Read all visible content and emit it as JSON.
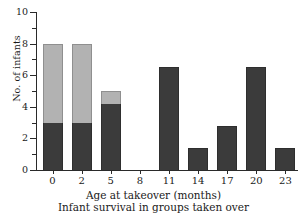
{
  "chart_data": {
    "type": "bar",
    "title": "",
    "subtitle": "Infant survival in groups taken over",
    "xlabel": "Age at takeover (months)",
    "ylabel": "No. of infants",
    "categories": [
      "0",
      "2",
      "5",
      "8",
      "11",
      "14",
      "17",
      "20",
      "23"
    ],
    "stacked": true,
    "series": [
      {
        "name": "survived",
        "color": "#3b3b3b",
        "values": [
          3,
          3,
          4.2,
          0,
          6.5,
          1.4,
          2.8,
          6.5,
          1.4
        ]
      },
      {
        "name": "died",
        "color": "#b2b2b2",
        "values": [
          5,
          5,
          0.8,
          0,
          0,
          0,
          0,
          0,
          0
        ]
      }
    ],
    "totals": [
      8,
      8,
      5,
      0,
      6.5,
      1.4,
      2.8,
      6.5,
      1.4
    ],
    "ylim": [
      0,
      10
    ],
    "yticks": [
      0,
      2,
      4,
      6,
      8,
      10
    ],
    "ytick_labels": [
      "0",
      "2",
      "4",
      "6",
      "8",
      "10"
    ],
    "yminor_ticks": [
      1,
      3,
      5,
      7,
      9
    ],
    "grid": false,
    "legend": "none"
  },
  "figure": {
    "background": "#ffffff",
    "axis_color": "#2a2a2a",
    "text_color": "#1a1a1a"
  }
}
